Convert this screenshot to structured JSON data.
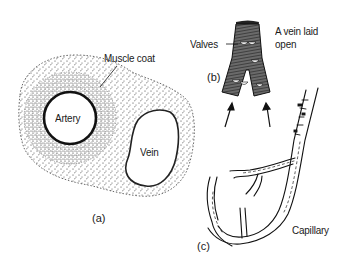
{
  "figure": {
    "panels": [
      {
        "id": "a",
        "tag": "(a)",
        "description": "Cross-section of an artery and a vein embedded in tissue",
        "labels": {
          "muscle_coat": "Muscle coat",
          "artery": "Artery",
          "vein": "Vein"
        }
      },
      {
        "id": "b",
        "tag": "(b)",
        "description": "A vein laid open showing valves",
        "labels": {
          "valves": "Valves",
          "vein_open_line1": "A vein laid",
          "vein_open_line2": "open"
        }
      },
      {
        "id": "c",
        "tag": "(c)",
        "description": "Capillary network branching from a vessel",
        "labels": {
          "capillary": "Capillary"
        }
      }
    ]
  },
  "colors": {
    "ink": "#1a1a1a",
    "background": "#ffffff",
    "vein_fill": "#555555"
  }
}
